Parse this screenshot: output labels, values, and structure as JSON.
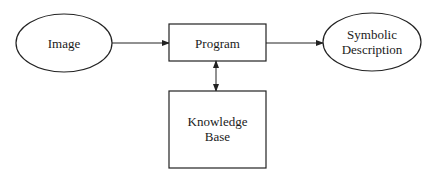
{
  "diagram": {
    "nodes": {
      "image": {
        "label": "Image",
        "shape": "ellipse"
      },
      "program": {
        "label": "Program",
        "shape": "rectangle"
      },
      "symbolic": {
        "label_lines": [
          "Symbolic",
          "Description"
        ],
        "shape": "ellipse"
      },
      "knowledge": {
        "label_lines": [
          "Knowledge",
          "Base"
        ],
        "shape": "rectangle"
      }
    },
    "edges": [
      {
        "from": "Image",
        "to": "Program",
        "direction": "forward"
      },
      {
        "from": "Program",
        "to": "Symbolic Description",
        "direction": "forward"
      },
      {
        "from": "Program",
        "to": "Knowledge Base",
        "direction": "bidirectional"
      }
    ],
    "colors": {
      "stroke": "#222222",
      "background": "#ffffff"
    }
  }
}
